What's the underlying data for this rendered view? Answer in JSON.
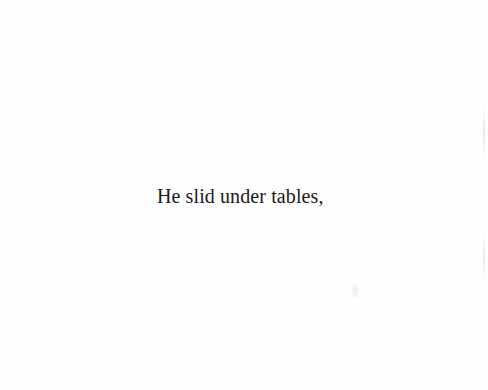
{
  "page": {
    "text_lines": [
      "He slid under tables,"
    ]
  }
}
